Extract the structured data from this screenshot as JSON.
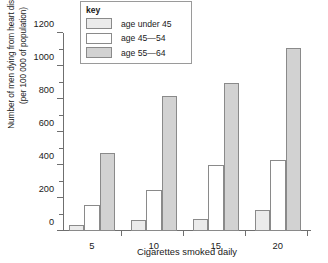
{
  "chart_data": {
    "type": "bar",
    "title": "",
    "xlabel": "Cigarettes smoked daily",
    "ylabel_line1": "Number of men dying from heart disease",
    "ylabel_line2": "(per 100 000 of population)",
    "categories": [
      "5",
      "10",
      "15",
      "20"
    ],
    "ylim": [
      0,
      1200
    ],
    "ytick_step": 200,
    "yminor_step": 100,
    "ytick_labels": [
      "0",
      "200",
      "400",
      "600",
      "800",
      "1000",
      "1200"
    ],
    "grid": false,
    "legend_position": "top-left-inside",
    "legend_title": "key",
    "series": [
      {
        "name": "age under 45",
        "color": "#ebebeb",
        "values": [
          35,
          65,
          70,
          130
        ]
      },
      {
        "name": "age 45—54",
        "color": "#ffffff",
        "values": [
          160,
          250,
          400,
          430
        ]
      },
      {
        "name": "age 55—64",
        "color": "#d2d2d2",
        "values": [
          470,
          820,
          900,
          1110
        ]
      }
    ]
  },
  "axis": {
    "color": "#6f6f6f"
  }
}
